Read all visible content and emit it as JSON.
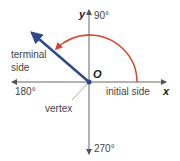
{
  "diagram": {
    "axes": {
      "x_label": "x",
      "y_label": "y",
      "origin_label": "O"
    },
    "angles": {
      "top": "90°",
      "left": "180°",
      "bottom": "270°"
    },
    "labels": {
      "terminal_side_line1": "terminal",
      "terminal_side_line2": "side",
      "initial_side": "initial side",
      "vertex": "vertex"
    },
    "colors": {
      "terminal": "#2e4a8c",
      "arc": "#d9452b",
      "axis": "#555555"
    }
  }
}
